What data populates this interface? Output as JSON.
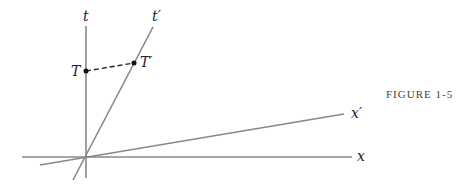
{
  "figure": {
    "caption": "FIGURE 1-5",
    "labels": {
      "t": "t",
      "t_prime": "t′",
      "x": "x",
      "x_prime": "x′",
      "T": "T",
      "T_prime": "T′"
    }
  }
}
